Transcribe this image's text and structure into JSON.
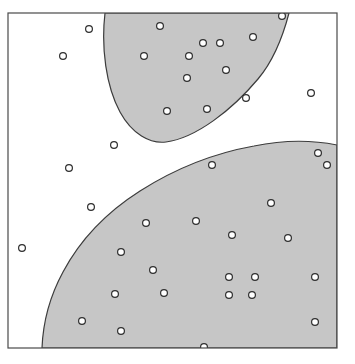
{
  "figure": {
    "kind": "decision-boundary-scatter",
    "caption": "",
    "background_color": "#ffffff",
    "frame": {
      "x": 8,
      "y": 13,
      "width": 329,
      "height": 335,
      "stroke_color": "#4a4a4a",
      "stroke_width": 1.2,
      "fill_color": "#ffffff"
    },
    "regions": {
      "shaded_fill_color": "#c6c6c6",
      "boundary_stroke_color": "#3c3c3c",
      "boundary_stroke_width": 1.2,
      "upper_blob_label": "upper-shaded-region",
      "lower_band_label": "lower-shaded-region",
      "unshaded_label": "unshaded-region",
      "upper_blob_path": "M 105,13 C 101,48 106,86 120,112 C 132,134 150,144 166,142 C 196,138 232,110 258,79 C 274,60 283,36 289,13 Z",
      "lower_band_path": "M 42,348 C 43,322 50,296 63,272 C 80,240 107,212 140,191 C 176,168 215,153 254,146 C 283,140 312,140 337,145 L 337,348 Z"
    }
  },
  "chart_data": {
    "type": "scatter",
    "title": "",
    "subtitle": "",
    "xlabel": "",
    "ylabel": "",
    "xlim": [
      8,
      337
    ],
    "ylim": [
      13,
      348
    ],
    "grid": false,
    "legend": null,
    "axis_ticks": {
      "x": [],
      "y": []
    },
    "marker": {
      "shape": "circle",
      "radius": 3.4,
      "fill": "#ffffff",
      "stroke": "#2e2e2e",
      "stroke_width": 1.2
    },
    "series": [
      {
        "name": "points",
        "points": [
          {
            "x": 89,
            "y": 29
          },
          {
            "x": 160,
            "y": 26
          },
          {
            "x": 63,
            "y": 56
          },
          {
            "x": 203,
            "y": 43
          },
          {
            "x": 220,
            "y": 43
          },
          {
            "x": 253,
            "y": 37
          },
          {
            "x": 282,
            "y": 16
          },
          {
            "x": 144,
            "y": 56
          },
          {
            "x": 189,
            "y": 56
          },
          {
            "x": 226,
            "y": 70
          },
          {
            "x": 187,
            "y": 78
          },
          {
            "x": 167,
            "y": 111
          },
          {
            "x": 207,
            "y": 109
          },
          {
            "x": 246,
            "y": 98
          },
          {
            "x": 311,
            "y": 93
          },
          {
            "x": 114,
            "y": 145
          },
          {
            "x": 212,
            "y": 165
          },
          {
            "x": 318,
            "y": 153
          },
          {
            "x": 327,
            "y": 165
          },
          {
            "x": 69,
            "y": 168
          },
          {
            "x": 271,
            "y": 203
          },
          {
            "x": 146,
            "y": 223
          },
          {
            "x": 196,
            "y": 221
          },
          {
            "x": 91,
            "y": 207
          },
          {
            "x": 232,
            "y": 235
          },
          {
            "x": 288,
            "y": 238
          },
          {
            "x": 22,
            "y": 248
          },
          {
            "x": 121,
            "y": 252
          },
          {
            "x": 153,
            "y": 270
          },
          {
            "x": 229,
            "y": 277
          },
          {
            "x": 255,
            "y": 277
          },
          {
            "x": 315,
            "y": 277
          },
          {
            "x": 115,
            "y": 294
          },
          {
            "x": 164,
            "y": 293
          },
          {
            "x": 229,
            "y": 295
          },
          {
            "x": 252,
            "y": 295
          },
          {
            "x": 82,
            "y": 321
          },
          {
            "x": 121,
            "y": 331
          },
          {
            "x": 204,
            "y": 347
          },
          {
            "x": 315,
            "y": 322
          }
        ]
      }
    ]
  }
}
